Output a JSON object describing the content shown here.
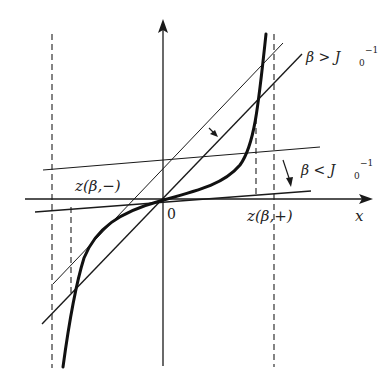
{
  "diagram": {
    "type": "graphical-solution-plot",
    "labels": {
      "x_axis": "x",
      "origin": "0",
      "z_minus": "z(β,−)",
      "z_plus": "z(β,+)",
      "beta_greater": "β > J",
      "beta_greater_sub": "0",
      "beta_greater_sup": "−1",
      "beta_less": "β < J",
      "beta_less_sub": "0",
      "beta_less_sup": "−1"
    },
    "colors": {
      "line": "#1a1a1a",
      "background": "#ffffff"
    }
  }
}
